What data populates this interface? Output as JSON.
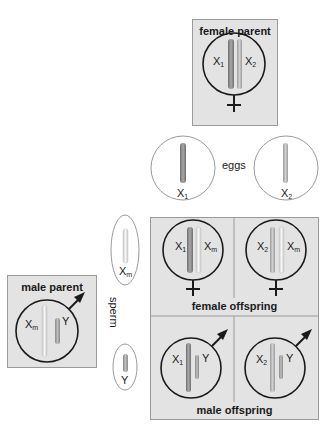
{
  "female_parent": {
    "title": "female parent",
    "chromosomes": [
      {
        "base": "X",
        "sub": "1",
        "shade": "dark"
      },
      {
        "base": "X",
        "sub": "2",
        "shade": "light"
      }
    ],
    "symbol": "female-symbol"
  },
  "male_parent": {
    "title": "male parent",
    "chromosomes": [
      {
        "base": "X",
        "sub": "m",
        "shade": "light"
      },
      {
        "base": "Y",
        "sub": "",
        "shade": "medium"
      }
    ],
    "symbol": "male-symbol"
  },
  "eggs": {
    "label": "eggs",
    "items": [
      {
        "base": "X",
        "sub": "1"
      },
      {
        "base": "X",
        "sub": "2"
      }
    ]
  },
  "sperm": {
    "label": "sperm",
    "items": [
      {
        "base": "X",
        "sub": "m"
      },
      {
        "base": "Y",
        "sub": ""
      }
    ]
  },
  "offspring": {
    "female_label": "female offspring",
    "male_label": "male offspring",
    "female": [
      {
        "a": {
          "base": "X",
          "sub": "1"
        },
        "b": {
          "base": "X",
          "sub": "m"
        }
      },
      {
        "a": {
          "base": "X",
          "sub": "2"
        },
        "b": {
          "base": "X",
          "sub": "m"
        }
      }
    ],
    "male": [
      {
        "a": {
          "base": "X",
          "sub": "1"
        },
        "b": {
          "base": "Y",
          "sub": ""
        }
      },
      {
        "a": {
          "base": "X",
          "sub": "2"
        },
        "b": {
          "base": "Y",
          "sub": ""
        }
      }
    ]
  },
  "colors": {
    "box": "#e3e3e3",
    "x1": "#8c8c8c",
    "x2": "#c4c4c4",
    "xm": "#e8e8e8",
    "y": "#9c9c9c"
  }
}
